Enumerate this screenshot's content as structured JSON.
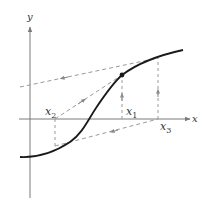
{
  "diagram": {
    "axes": {
      "x_label": "x",
      "y_label": "y"
    },
    "points": [
      {
        "name": "x1",
        "base": "x",
        "sub": "1"
      },
      {
        "name": "x2",
        "base": "x",
        "sub": "2"
      },
      {
        "name": "x3",
        "base": "x",
        "sub": "3"
      }
    ],
    "colors": {
      "curve": "#1a1a1a",
      "axis": "#7a7a7a",
      "dashed": "#9a9a9a",
      "text": "#333333"
    }
  }
}
